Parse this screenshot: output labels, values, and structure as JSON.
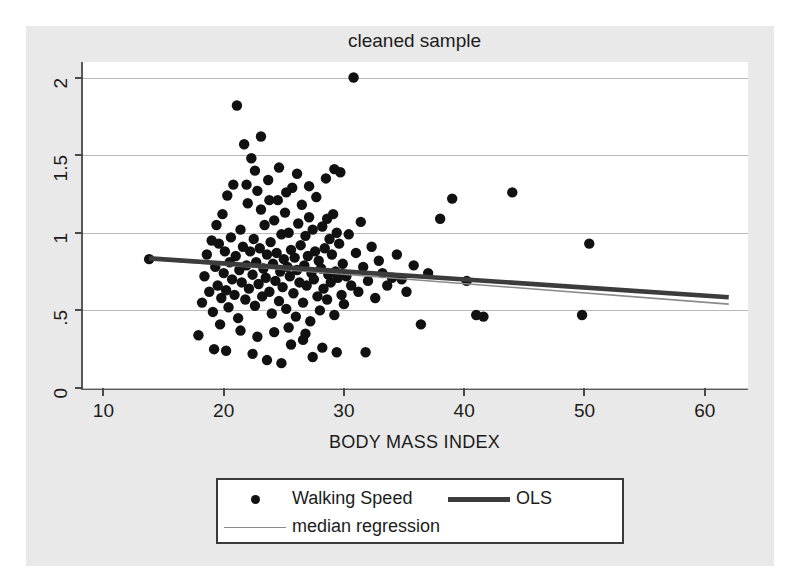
{
  "figure": {
    "title": "cleaned sample",
    "xlabel": "BODY MASS INDEX",
    "ylabel": ""
  },
  "legend": {
    "items": [
      {
        "label": "Walking Speed",
        "key": "dot-marker"
      },
      {
        "label": "OLS",
        "key": "thick-line"
      },
      {
        "label": "median regression",
        "key": "thin-line"
      }
    ]
  },
  "colors": {
    "marker": "#111111",
    "ols_line": "#3c3c3c",
    "median_line": "#8a8a8a",
    "grid": "#b9b9b9",
    "axis": "#5a5a5a",
    "page_background": "#e9e9e9",
    "plot_background": "#ffffff"
  },
  "chart_data": {
    "type": "scatter",
    "title": "cleaned sample",
    "xlabel": "BODY MASS INDEX",
    "ylabel": "",
    "xlim": [
      8.3,
      63.6
    ],
    "ylim": [
      0,
      2.1
    ],
    "xticks": [
      10,
      20,
      30,
      40,
      50,
      60
    ],
    "yticks": [
      0,
      0.5,
      1,
      1.5,
      2
    ],
    "ytick_labels": [
      "0",
      ".5",
      "1",
      "1.5",
      "2"
    ],
    "xtick_labels": [
      "10",
      "20",
      "30",
      "40",
      "50",
      "60"
    ],
    "grid": "horizontal",
    "legend_position": "below-axes",
    "series": [
      {
        "name": "Walking Speed",
        "type": "scatter",
        "marker": "circle",
        "points": [
          [
            13.8,
            0.83
          ],
          [
            17.9,
            0.34
          ],
          [
            18.2,
            0.55
          ],
          [
            18.4,
            0.72
          ],
          [
            18.6,
            0.86
          ],
          [
            18.8,
            0.62
          ],
          [
            19.0,
            0.95
          ],
          [
            19.1,
            0.49
          ],
          [
            19.3,
            0.78
          ],
          [
            19.4,
            1.05
          ],
          [
            19.5,
            0.66
          ],
          [
            19.6,
            0.93
          ],
          [
            19.7,
            0.41
          ],
          [
            19.8,
            0.58
          ],
          [
            19.9,
            1.12
          ],
          [
            20.0,
            0.74
          ],
          [
            20.1,
            0.88
          ],
          [
            20.2,
            0.63
          ],
          [
            20.3,
            1.24
          ],
          [
            20.4,
            0.52
          ],
          [
            20.5,
            0.81
          ],
          [
            20.6,
            0.97
          ],
          [
            20.7,
            0.7
          ],
          [
            20.8,
            1.31
          ],
          [
            20.9,
            0.6
          ],
          [
            21.0,
            0.85
          ],
          [
            21.1,
            1.82
          ],
          [
            21.2,
            0.45
          ],
          [
            21.3,
            0.76
          ],
          [
            21.4,
            1.02
          ],
          [
            21.5,
            0.68
          ],
          [
            21.6,
            0.91
          ],
          [
            21.7,
            1.57
          ],
          [
            21.8,
            0.57
          ],
          [
            21.9,
            0.79
          ],
          [
            22.0,
            1.19
          ],
          [
            22.1,
            0.64
          ],
          [
            22.2,
            0.88
          ],
          [
            22.3,
            1.48
          ],
          [
            22.4,
            0.73
          ],
          [
            22.5,
            0.96
          ],
          [
            22.6,
            0.53
          ],
          [
            22.7,
            0.81
          ],
          [
            22.8,
            1.27
          ],
          [
            22.9,
            0.67
          ],
          [
            23.0,
            0.9
          ],
          [
            23.1,
            1.15
          ],
          [
            23.2,
            0.59
          ],
          [
            23.3,
            0.77
          ],
          [
            23.4,
            1.05
          ],
          [
            23.5,
            0.71
          ],
          [
            23.6,
            0.86
          ],
          [
            23.7,
            1.34
          ],
          [
            23.8,
            0.62
          ],
          [
            23.9,
            0.94
          ],
          [
            24.0,
            0.48
          ],
          [
            24.1,
            0.8
          ],
          [
            24.2,
            1.08
          ],
          [
            24.3,
            0.69
          ],
          [
            24.4,
            0.87
          ],
          [
            24.5,
            1.21
          ],
          [
            24.6,
            0.56
          ],
          [
            24.7,
            0.75
          ],
          [
            24.8,
            0.99
          ],
          [
            24.9,
            0.65
          ],
          [
            25.0,
            0.83
          ],
          [
            25.1,
            1.13
          ],
          [
            25.2,
            0.51
          ],
          [
            25.3,
            0.78
          ],
          [
            25.4,
            1.0
          ],
          [
            25.5,
            0.72
          ],
          [
            25.6,
            0.89
          ],
          [
            25.7,
            1.29
          ],
          [
            25.8,
            0.61
          ],
          [
            25.9,
            0.84
          ],
          [
            26.0,
            0.46
          ],
          [
            26.1,
            0.76
          ],
          [
            26.2,
            1.06
          ],
          [
            26.3,
            0.68
          ],
          [
            26.4,
            0.92
          ],
          [
            26.5,
            1.18
          ],
          [
            26.6,
            0.55
          ],
          [
            26.7,
            0.79
          ],
          [
            26.8,
            0.98
          ],
          [
            26.9,
            0.66
          ],
          [
            27.0,
            0.85
          ],
          [
            27.1,
            1.1
          ],
          [
            27.2,
            0.43
          ],
          [
            27.3,
            0.74
          ],
          [
            27.4,
            1.02
          ],
          [
            27.5,
            0.7
          ],
          [
            27.6,
            0.88
          ],
          [
            27.7,
            1.23
          ],
          [
            27.8,
            0.59
          ],
          [
            27.9,
            0.82
          ],
          [
            28.0,
            0.5
          ],
          [
            28.1,
            0.77
          ],
          [
            28.2,
            1.04
          ],
          [
            28.3,
            0.64
          ],
          [
            28.4,
            0.9
          ],
          [
            28.5,
            1.35
          ],
          [
            28.6,
            0.57
          ],
          [
            28.7,
            0.73
          ],
          [
            28.8,
            0.96
          ],
          [
            28.9,
            0.68
          ],
          [
            29.0,
            0.86
          ],
          [
            29.1,
            1.12
          ],
          [
            29.2,
            0.47
          ],
          [
            29.3,
            0.75
          ],
          [
            29.4,
            1.0
          ],
          [
            29.5,
            0.71
          ],
          [
            29.6,
            0.93
          ],
          [
            29.7,
            1.39
          ],
          [
            29.8,
            0.6
          ],
          [
            29.9,
            0.8
          ],
          [
            30.0,
            0.54
          ],
          [
            30.2,
            0.72
          ],
          [
            30.4,
            0.99
          ],
          [
            30.6,
            0.66
          ],
          [
            30.8,
            2.0
          ],
          [
            31.0,
            0.87
          ],
          [
            31.2,
            0.62
          ],
          [
            31.4,
            1.07
          ],
          [
            31.6,
            0.78
          ],
          [
            31.8,
            0.23
          ],
          [
            32.0,
            0.69
          ],
          [
            32.3,
            0.91
          ],
          [
            32.6,
            0.58
          ],
          [
            32.9,
            0.82
          ],
          [
            33.2,
            0.74
          ],
          [
            33.6,
            0.66
          ],
          [
            34.0,
            0.71
          ],
          [
            34.4,
            0.86
          ],
          [
            34.8,
            0.7
          ],
          [
            35.2,
            0.62
          ],
          [
            35.8,
            0.79
          ],
          [
            36.4,
            0.41
          ],
          [
            37.0,
            0.74
          ],
          [
            38.0,
            1.09
          ],
          [
            39.0,
            1.22
          ],
          [
            40.2,
            0.69
          ],
          [
            41.0,
            0.47
          ],
          [
            41.6,
            0.46
          ],
          [
            44.0,
            1.26
          ],
          [
            49.8,
            0.47
          ],
          [
            50.4,
            0.93
          ],
          [
            19.2,
            0.25
          ],
          [
            20.2,
            0.24
          ],
          [
            22.4,
            0.22
          ],
          [
            23.6,
            0.18
          ],
          [
            24.8,
            0.16
          ],
          [
            25.6,
            0.28
          ],
          [
            26.6,
            0.31
          ],
          [
            27.4,
            0.2
          ],
          [
            28.2,
            0.26
          ],
          [
            29.4,
            0.23
          ],
          [
            21.4,
            0.37
          ],
          [
            22.8,
            0.33
          ],
          [
            24.2,
            0.36
          ],
          [
            25.4,
            0.39
          ],
          [
            26.8,
            0.35
          ],
          [
            23.1,
            1.62
          ],
          [
            22.6,
            1.4
          ],
          [
            24.6,
            1.42
          ],
          [
            27.1,
            1.3
          ],
          [
            21.9,
            1.31
          ],
          [
            25.2,
            1.26
          ],
          [
            26.1,
            1.38
          ],
          [
            29.2,
            1.41
          ],
          [
            23.8,
            1.21
          ],
          [
            28.6,
            1.09
          ]
        ]
      },
      {
        "name": "OLS",
        "type": "line",
        "points": [
          [
            13.8,
            0.835
          ],
          [
            62.0,
            0.585
          ]
        ]
      },
      {
        "name": "median regression",
        "type": "line",
        "points": [
          [
            13.8,
            0.83
          ],
          [
            62.0,
            0.54
          ]
        ]
      }
    ]
  }
}
